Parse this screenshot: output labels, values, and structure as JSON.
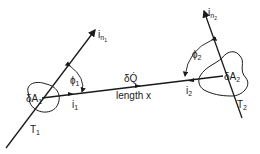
{
  "diagram": {
    "type": "radiative exchange between two surface elements",
    "surface1": {
      "label": "δA",
      "sub": "1",
      "tangent": "T",
      "tangent_sub": "1",
      "normal": "i",
      "normal_sub": "n",
      "normal_subsub": "1",
      "angle": "ϕ",
      "angle_sub": "1",
      "direction": "i",
      "direction_sub": "1"
    },
    "surface2": {
      "label": "δA",
      "sub": "2",
      "tangent": "T",
      "tangent_sub": "2",
      "normal": "i",
      "normal_sub": "n",
      "normal_subsub": "2",
      "angle": "ϕ",
      "angle_sub": "2",
      "direction": "i",
      "direction_sub": "2"
    },
    "connector": {
      "heat": "δQ̇",
      "length": "length x"
    }
  }
}
